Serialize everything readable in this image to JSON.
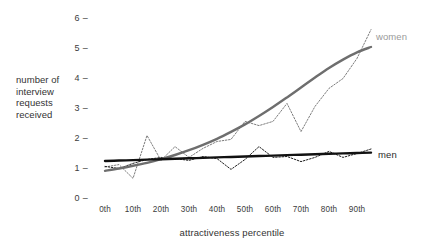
{
  "chart_data": {
    "type": "line",
    "title": "",
    "xlabel": "attractiveness percentile",
    "ylabel": "number of interview requests received",
    "ylabel_lines": [
      "number of",
      "interview",
      "requests",
      "received"
    ],
    "xlim": [
      0,
      100
    ],
    "ylim": [
      0,
      6.2
    ],
    "grid": false,
    "legend_position": "right-inline",
    "yticks": [
      "6",
      "5",
      "4",
      "3",
      "2",
      "1",
      "0"
    ],
    "ytick_values": [
      6,
      5,
      4,
      3,
      2,
      1,
      0
    ],
    "xticks": [
      "0th",
      "10th",
      "20th",
      "30th",
      "40th",
      "50th",
      "60th",
      "70th",
      "80th",
      "90th"
    ],
    "xtick_values": [
      0,
      10,
      20,
      30,
      40,
      50,
      60,
      70,
      80,
      90
    ],
    "x": [
      0,
      5,
      10,
      15,
      20,
      25,
      30,
      35,
      40,
      45,
      50,
      55,
      60,
      65,
      70,
      75,
      80,
      85,
      90,
      95
    ],
    "series": [
      {
        "name": "women",
        "color": "#7d7d7d",
        "style": "dotted-observed",
        "values": [
          1.1,
          1.18,
          0.72,
          2.15,
          1.32,
          1.78,
          1.42,
          1.72,
          1.95,
          2.02,
          2.62,
          2.48,
          2.62,
          3.22,
          2.28,
          3.12,
          3.72,
          4.05,
          4.72,
          5.68
        ]
      },
      {
        "name": "men",
        "color": "#1f1f1f",
        "style": "dotted-observed",
        "values": [
          1.12,
          1.05,
          1.22,
          1.35,
          1.42,
          1.38,
          1.32,
          1.45,
          1.38,
          1.02,
          1.35,
          1.78,
          1.42,
          1.45,
          1.28,
          1.42,
          1.62,
          1.42,
          1.55,
          1.7
        ]
      }
    ],
    "trends": [
      {
        "name": "women-trend",
        "color": "#6e6e6e",
        "style": "smooth-fit",
        "values": [
          0.97,
          1.05,
          1.14,
          1.24,
          1.36,
          1.5,
          1.66,
          1.84,
          2.04,
          2.27,
          2.52,
          2.8,
          3.1,
          3.42,
          3.75,
          4.08,
          4.4,
          4.68,
          4.92,
          5.1
        ]
      },
      {
        "name": "men-trend",
        "color": "#111111",
        "style": "linear-fit",
        "values": [
          1.3,
          1.315,
          1.33,
          1.345,
          1.36,
          1.375,
          1.39,
          1.405,
          1.42,
          1.435,
          1.45,
          1.465,
          1.48,
          1.495,
          1.51,
          1.525,
          1.54,
          1.553,
          1.566,
          1.58
        ]
      }
    ],
    "legend": [
      {
        "label": "women",
        "color": "#9a9a9a"
      },
      {
        "label": "men",
        "color": "#2a2a2a"
      }
    ]
  },
  "axis": {
    "y_tick_dash": "–",
    "y_label_line1": "number of",
    "y_label_line2": "interview",
    "y_label_line3": "requests",
    "y_label_line4": "received",
    "y_tick_6": "6",
    "y_tick_5": "5",
    "y_tick_4": "4",
    "y_tick_3": "3",
    "y_tick_2": "2",
    "y_tick_1": "1",
    "y_tick_0": "0",
    "x_tick_0": "0th",
    "x_tick_1": "10th",
    "x_tick_2": "20th",
    "x_tick_3": "30th",
    "x_tick_4": "40th",
    "x_tick_5": "50th",
    "x_tick_6": "60th",
    "x_tick_7": "70th",
    "x_tick_8": "80th",
    "x_tick_9": "90th",
    "x_title": "attractiveness percentile"
  },
  "labels": {
    "women": "women",
    "men": "men"
  }
}
